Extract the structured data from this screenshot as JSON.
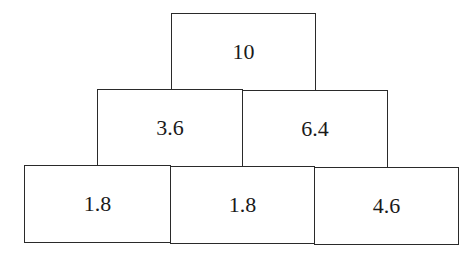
{
  "pyramid": {
    "rows": [
      {
        "cells": [
          {
            "value": "10"
          }
        ]
      },
      {
        "cells": [
          {
            "value": "3.6"
          },
          {
            "value": "6.4"
          }
        ]
      },
      {
        "cells": [
          {
            "value": "1.8"
          },
          {
            "value": "1.8"
          },
          {
            "value": "4.6"
          }
        ]
      }
    ]
  }
}
